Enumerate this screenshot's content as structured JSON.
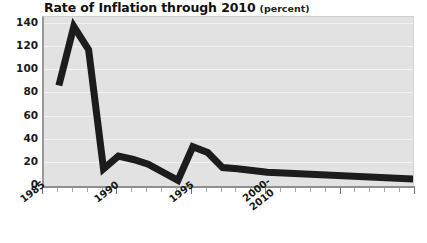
{
  "title": {
    "main": "Rate of Inflation through 2010",
    "unit": "(percent)"
  },
  "axes": {
    "y_ticks": [
      "0",
      "20",
      "40",
      "60",
      "80",
      "100",
      "120",
      "140"
    ],
    "x_labels": [
      "1985",
      "1990",
      "1995",
      "2000-",
      "2010"
    ]
  },
  "chart_data": {
    "type": "line",
    "title": "Rate of Inflation through 2010 (percent)",
    "xlabel": "",
    "ylabel": "percent",
    "ylim": [
      0,
      140
    ],
    "xlim": [
      1985,
      2010
    ],
    "grid": true,
    "legend": "none",
    "line_color": "#1c1c1c",
    "plot_background": "#e2e2e2",
    "x": [
      1986,
      1987,
      1988,
      1989,
      1990,
      1991,
      1992,
      1993,
      1994,
      1995,
      1996,
      1997,
      1998,
      2000,
      2010
    ],
    "values": [
      86,
      137,
      117,
      14,
      25,
      22,
      18,
      11,
      4,
      33,
      28,
      15,
      14,
      11,
      5
    ],
    "tick_labels_x": [
      "1985",
      "1990",
      "1995",
      "2000-2010"
    ],
    "tick_values_y": [
      0,
      20,
      40,
      60,
      80,
      100,
      120,
      140
    ],
    "annotations": []
  }
}
